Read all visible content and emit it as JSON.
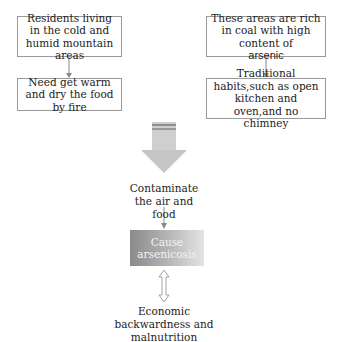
{
  "diagram": {
    "left_column": [
      {
        "text": "Residents living in the cold and humid mountain areas"
      },
      {
        "text": "Need get warm and dry the food by fire"
      }
    ],
    "right_column": [
      {
        "text_main": "These areas are rich in coal with high content of",
        "text_emph": "arsenic"
      },
      {
        "text": "Traditional habits,such as open kitchen and oven,and no chimney"
      }
    ],
    "center": {
      "contaminate": "Contaminate the air and food",
      "cause": "Cause arsenicosis",
      "outcome": "Economic backwardness and malnutrition"
    },
    "colors": {
      "box_border": "#9a9a9a",
      "arrow": "#888888",
      "big_arrow": "#c8c8c8",
      "gradient_start": "#8a8a8a",
      "gradient_end": "#e4e4e4"
    }
  }
}
